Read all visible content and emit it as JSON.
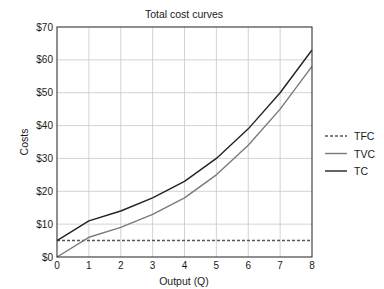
{
  "chart_data": {
    "type": "line",
    "title": "Total cost curves",
    "xlabel": "Output (Q)",
    "ylabel": "Costs",
    "x": [
      0,
      1,
      2,
      3,
      4,
      5,
      6,
      7,
      8
    ],
    "xlim": [
      0,
      8
    ],
    "ylim": [
      0,
      70
    ],
    "x_ticks": [
      "0",
      "1",
      "2",
      "3",
      "4",
      "5",
      "6",
      "7",
      "8"
    ],
    "y_ticks": [
      {
        "value": 0,
        "label": "$0"
      },
      {
        "value": 10,
        "label": "$10"
      },
      {
        "value": 20,
        "label": "$20"
      },
      {
        "value": 30,
        "label": "$30"
      },
      {
        "value": 40,
        "label": "$40"
      },
      {
        "value": 50,
        "label": "$50"
      },
      {
        "value": 60,
        "label": "$60"
      },
      {
        "value": 70,
        "label": "$70"
      }
    ],
    "grid": true,
    "legend_position": "right",
    "series": [
      {
        "name": "TFC",
        "values": [
          5,
          5,
          5,
          5,
          5,
          5,
          5,
          5,
          5
        ],
        "color": "#555555",
        "style": "dashed"
      },
      {
        "name": "TVC",
        "values": [
          0,
          6,
          9,
          13,
          18,
          25,
          34,
          45,
          58
        ],
        "color": "#7a7a7a",
        "style": "solid"
      },
      {
        "name": "TC",
        "values": [
          5,
          11,
          14,
          18,
          23,
          30,
          39,
          50,
          63
        ],
        "color": "#222222",
        "style": "solid"
      }
    ]
  }
}
